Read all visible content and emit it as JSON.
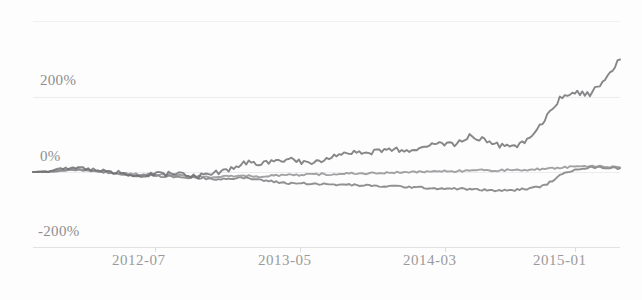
{
  "chart_data": {
    "type": "line",
    "title": "",
    "xlabel": "",
    "ylabel": "",
    "ylim": [
      -300,
      400
    ],
    "xlim": [
      "2012-01",
      "2015-05"
    ],
    "grid": true,
    "legend": "none",
    "y_ticks": [
      "200%",
      "0%",
      "-200%"
    ],
    "y_tick_values": [
      200,
      0,
      -200
    ],
    "x_ticks": [
      "2012-07",
      "2013-05",
      "2014-03",
      "2015-01"
    ],
    "series": [
      {
        "name": "series-1",
        "color": "#6d6d70",
        "x": [
          "2012-01",
          "2012-02",
          "2012-03",
          "2012-04",
          "2012-05",
          "2012-06",
          "2012-07",
          "2012-08",
          "2012-09",
          "2012-10",
          "2012-11",
          "2012-12",
          "2013-01",
          "2013-02",
          "2013-03",
          "2013-04",
          "2013-05",
          "2013-06",
          "2013-07",
          "2013-08",
          "2013-09",
          "2013-10",
          "2013-11",
          "2013-12",
          "2014-01",
          "2014-02",
          "2014-03",
          "2014-04",
          "2014-05",
          "2014-06",
          "2014-07",
          "2014-08",
          "2014-09",
          "2014-10",
          "2014-11",
          "2014-12",
          "2015-01",
          "2015-02",
          "2015-03",
          "2015-04"
        ],
        "values": [
          0,
          2,
          8,
          12,
          6,
          2,
          -4,
          -8,
          -6,
          -4,
          -8,
          -10,
          -4,
          6,
          26,
          22,
          30,
          34,
          24,
          28,
          46,
          52,
          48,
          56,
          60,
          54,
          64,
          78,
          72,
          96,
          86,
          70,
          66,
          92,
          140,
          196,
          212,
          206,
          248,
          300
        ]
      },
      {
        "name": "series-2",
        "color": "#8e8e91",
        "x": [
          "2012-01",
          "2012-02",
          "2012-03",
          "2012-04",
          "2012-05",
          "2012-06",
          "2012-07",
          "2012-08",
          "2012-09",
          "2012-10",
          "2012-11",
          "2012-12",
          "2013-01",
          "2013-02",
          "2013-03",
          "2013-04",
          "2013-05",
          "2013-06",
          "2013-07",
          "2013-08",
          "2013-09",
          "2013-10",
          "2013-11",
          "2013-12",
          "2014-01",
          "2014-02",
          "2014-03",
          "2014-04",
          "2014-05",
          "2014-06",
          "2014-07",
          "2014-08",
          "2014-09",
          "2014-10",
          "2014-11",
          "2014-12",
          "2015-01",
          "2015-02",
          "2015-03",
          "2015-04"
        ],
        "values": [
          0,
          2,
          6,
          8,
          4,
          0,
          -4,
          -6,
          -6,
          -8,
          -10,
          -12,
          -14,
          -12,
          -10,
          -12,
          -10,
          -8,
          -8,
          -6,
          -6,
          -4,
          -4,
          -2,
          -2,
          0,
          0,
          2,
          2,
          4,
          4,
          4,
          6,
          6,
          8,
          12,
          14,
          16,
          14,
          12
        ]
      },
      {
        "name": "series-3",
        "color": "#77777a",
        "x": [
          "2012-01",
          "2012-02",
          "2012-03",
          "2012-04",
          "2012-05",
          "2012-06",
          "2012-07",
          "2012-08",
          "2012-09",
          "2012-10",
          "2012-11",
          "2012-12",
          "2013-01",
          "2013-02",
          "2013-03",
          "2013-04",
          "2013-05",
          "2013-06",
          "2013-07",
          "2013-08",
          "2013-09",
          "2013-10",
          "2013-11",
          "2013-12",
          "2014-01",
          "2014-02",
          "2014-03",
          "2014-04",
          "2014-05",
          "2014-06",
          "2014-07",
          "2014-08",
          "2014-09",
          "2014-10",
          "2014-11",
          "2014-12",
          "2015-01",
          "2015-02",
          "2015-03",
          "2015-04"
        ],
        "values": [
          0,
          0,
          4,
          6,
          2,
          -2,
          -6,
          -10,
          -10,
          -12,
          -14,
          -16,
          -18,
          -18,
          -16,
          -20,
          -26,
          -30,
          -30,
          -32,
          -34,
          -34,
          -36,
          -38,
          -38,
          -40,
          -42,
          -44,
          -44,
          -46,
          -48,
          -50,
          -48,
          -44,
          -36,
          -10,
          8,
          12,
          12,
          10
        ]
      }
    ]
  }
}
